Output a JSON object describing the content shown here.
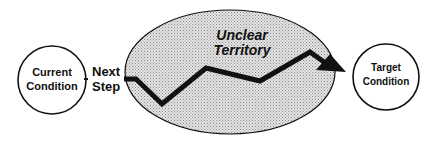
{
  "diagram": {
    "current": {
      "line1": "Current",
      "line2": "Condition"
    },
    "next_step": {
      "line1": "Next",
      "line2": "Step"
    },
    "unclear": {
      "line1": "Unclear",
      "line2": "Territory"
    },
    "target": {
      "line1": "Target",
      "line2": "Condition"
    }
  },
  "colors": {
    "stroke": "#111111",
    "fill_pattern": "#c8c8c8"
  }
}
